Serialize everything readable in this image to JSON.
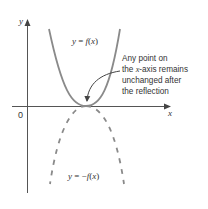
{
  "diagram": {
    "axes": {
      "x_label": "x",
      "y_label": "y",
      "origin_label": "0"
    },
    "curves": [
      {
        "name": "y = f(x)",
        "label": "y = f(x)",
        "style": "solid",
        "color": "#8a8a8a"
      },
      {
        "name": "y = -f(x)",
        "label": "y = −f(x)",
        "style": "dashed",
        "color": "#8a8a8a"
      }
    ],
    "annotation": {
      "lines": [
        "Any point on",
        "the x-axis remains",
        "unchanged after",
        "the reflection"
      ],
      "line2_prefix": "the ",
      "line2_italic": "x",
      "line2_suffix": "-axis remains"
    },
    "colors": {
      "axis": "#555555",
      "curve": "#8a8a8a",
      "text": "#333333"
    }
  }
}
